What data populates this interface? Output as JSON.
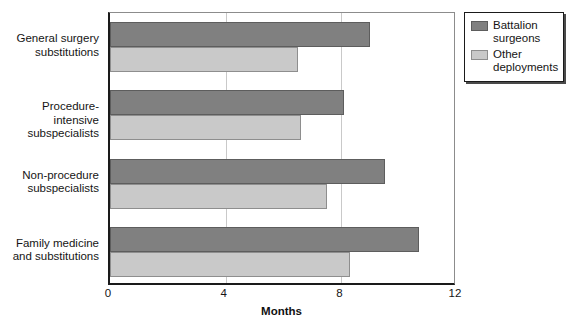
{
  "chart_data": {
    "type": "bar",
    "orientation": "horizontal",
    "title": "",
    "xlabel": "Months",
    "ylabel": "",
    "xlim": [
      0,
      12
    ],
    "xticks": [
      "0",
      "4",
      "8",
      "12"
    ],
    "xtick_values": [
      0,
      4,
      8,
      12
    ],
    "grid": true,
    "legend_position": "top-right",
    "categories": [
      "General surgery\nsubstitutions",
      "Procedure-intensive\nsubspecialists",
      "Non-procedure\nsubspecialists",
      "Family medicine\nand substitutions"
    ],
    "series": [
      {
        "name": "Battalion\nsurgeons",
        "color": "#808080",
        "values": [
          9.0,
          8.1,
          9.5,
          10.7
        ]
      },
      {
        "name": "Other\ndeployments",
        "color": "#c9c9c9",
        "values": [
          6.5,
          6.6,
          7.5,
          8.3
        ]
      }
    ]
  },
  "legend": {
    "entries": [
      {
        "label": "Battalion\nsurgeons",
        "swatch": "dark"
      },
      {
        "label": "Other\ndeployments",
        "swatch": "light"
      }
    ]
  }
}
